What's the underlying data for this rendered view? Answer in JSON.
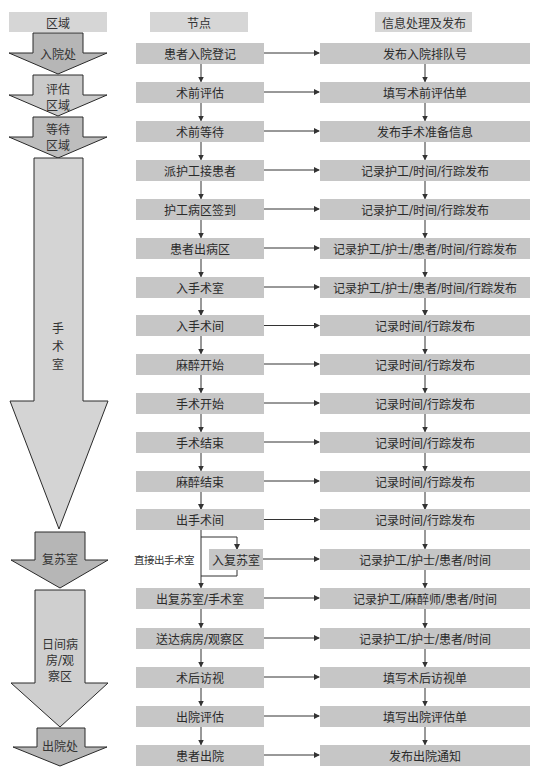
{
  "headers": {
    "region": "区域",
    "node": "节点",
    "info": "信息处理及发布"
  },
  "regions": [
    {
      "lines": [
        "入院处"
      ]
    },
    {
      "lines": [
        "评估",
        "区域"
      ]
    },
    {
      "lines": [
        "等待",
        "区域"
      ]
    },
    {
      "lines": [
        "手",
        "术",
        "室"
      ]
    },
    {
      "lines": [
        "复苏室"
      ]
    },
    {
      "lines": [
        "日间病",
        "房/观",
        "察区"
      ]
    },
    {
      "lines": [
        "出院处"
      ]
    }
  ],
  "flow": [
    {
      "node": "患者入院登记",
      "info": "发布入院排队号"
    },
    {
      "node": "术前评估",
      "info": "填写术前评估单"
    },
    {
      "node": "术前等待",
      "info": "发布手术准备信息"
    },
    {
      "node": "派护工接患者",
      "info": "记录护工/时间/行踪发布"
    },
    {
      "node": "护工病区签到",
      "info": "记录护工/时间/行踪发布"
    },
    {
      "node": "患者出病区",
      "info": "记录护工/护士/患者/时间/行踪发布"
    },
    {
      "node": "入手术室",
      "info": "记录护工/护士/患者/时间/行踪发布"
    },
    {
      "node": "入手术间",
      "info": "记录时间/行踪发布"
    },
    {
      "node": "麻醉开始",
      "info": "记录时间/行踪发布"
    },
    {
      "node": "手术开始",
      "info": "记录时间/行踪发布"
    },
    {
      "node": "手术结束",
      "info": "记录时间/行踪发布"
    },
    {
      "node": "麻醉结束",
      "info": "记录时间/行踪发布"
    },
    {
      "node": "出手术间",
      "info": "记录时间/行踪发布"
    },
    {
      "node": "入复苏室",
      "info": "记录护工/护士/患者/时间",
      "side_label": "直接出手术室"
    },
    {
      "node": "出复苏室/手术室",
      "info": "记录护工/麻醉师/患者/时间"
    },
    {
      "node": "送达病房/观察区",
      "info": "记录护工/护士/患者/时间"
    },
    {
      "node": "术后访视",
      "info": "填写术后访视单"
    },
    {
      "node": "出院评估",
      "info": "填写出院评估单"
    },
    {
      "node": "患者出院",
      "info": "发布出院通知"
    }
  ],
  "colors": {
    "header_fill": "#d6d6d6",
    "box_fill": "#c6c6c6",
    "arrow_dark": "#b6b6b6",
    "arrow_light": "#d3d3d3",
    "line": "#333333"
  }
}
